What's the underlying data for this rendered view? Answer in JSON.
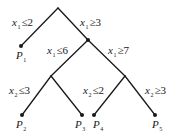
{
  "diagram": {
    "type": "branch-and-bound-tree",
    "line_color": "#1a1a1a",
    "text_color": "#1a1a1a",
    "background": "#ffffff"
  },
  "branches": [
    {
      "id": "b1",
      "var": "x",
      "sub": "1",
      "op": "≤",
      "value": "2",
      "to": "P1"
    },
    {
      "id": "b2",
      "var": "x",
      "sub": "1",
      "op": "≥",
      "value": "3",
      "to": "N1"
    },
    {
      "id": "b3",
      "var": "x",
      "sub": "1",
      "op": "≤",
      "value": "6",
      "to": "N2"
    },
    {
      "id": "b4",
      "var": "x",
      "sub": "1",
      "op": "≥",
      "value": "7",
      "to": "N3"
    },
    {
      "id": "b5",
      "var": "x",
      "sub": "2",
      "op": "≤",
      "value": "3",
      "to": "P2"
    },
    {
      "id": "b6",
      "var": "x",
      "sub": "2",
      "op": "≤",
      "value": "2",
      "to": "P4"
    },
    {
      "id": "b7",
      "var": "x",
      "sub": "2",
      "op": "≥",
      "value": "3",
      "to": "P5"
    }
  ],
  "leaves": [
    {
      "id": "P1",
      "letter": "P",
      "sub": "1"
    },
    {
      "id": "P2",
      "letter": "P",
      "sub": "2"
    },
    {
      "id": "P3",
      "letter": "P",
      "sub": "3"
    },
    {
      "id": "P4",
      "letter": "P",
      "sub": "4"
    },
    {
      "id": "P5",
      "letter": "P",
      "sub": "5"
    }
  ]
}
